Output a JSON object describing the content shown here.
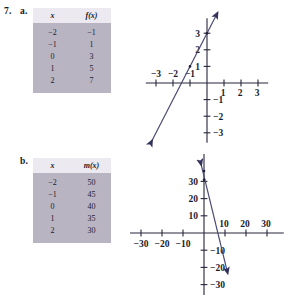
{
  "exercise": {
    "number": "7.",
    "part_a_label": "a.",
    "part_b_label": "b."
  },
  "part_a": {
    "table": {
      "headers": [
        "x",
        "f(x)"
      ],
      "rows": [
        [
          "−2",
          "−1"
        ],
        [
          "−1",
          "1"
        ],
        [
          "0",
          "3"
        ],
        [
          "1",
          "5"
        ],
        [
          "2",
          "7"
        ]
      ]
    },
    "chart_data": {
      "type": "line",
      "title": "",
      "xlabel": "",
      "ylabel": "",
      "xlim": [
        -3.6,
        3.6
      ],
      "ylim": [
        -3.6,
        3.9
      ],
      "grid": false,
      "x_ticks": [
        -3,
        -2,
        -1,
        1,
        2,
        3
      ],
      "y_ticks": [
        -3,
        -2,
        -1,
        1,
        2,
        3
      ],
      "x_tick_labels": [
        "−3",
        "−2",
        "−1",
        "1",
        "2",
        "3"
      ],
      "y_tick_labels": [
        "−3",
        "−2",
        "−1",
        "1",
        "2",
        "3"
      ],
      "series": [
        {
          "name": "f(x) = 2x + 3",
          "slope": 2,
          "intercept": 3,
          "x_from": -3.3,
          "x_to": 0.55,
          "arrows": "both"
        }
      ],
      "points": [
        {
          "x": -1,
          "y": 1
        },
        {
          "x": 0,
          "y": 3
        }
      ]
    }
  },
  "part_b": {
    "table": {
      "headers": [
        "x",
        "m(x)"
      ],
      "rows": [
        [
          "−2",
          "50"
        ],
        [
          "−1",
          "45"
        ],
        [
          "0",
          "40"
        ],
        [
          "1",
          "35"
        ],
        [
          "2",
          "30"
        ]
      ]
    },
    "chart_data": {
      "type": "line",
      "title": "",
      "xlabel": "",
      "ylabel": "",
      "xlim": [
        -38,
        38
      ],
      "ylim": [
        -36,
        46
      ],
      "grid": false,
      "x_ticks": [
        -30,
        -20,
        -10,
        10,
        20,
        30
      ],
      "y_ticks": [
        -30,
        -20,
        -10,
        10,
        20,
        30
      ],
      "x_tick_labels": [
        "−30",
        "−20",
        "−10",
        "10",
        "20",
        "30"
      ],
      "y_tick_labels": [
        "−30",
        "−20",
        "−10",
        "10",
        "20",
        "30"
      ],
      "series": [
        {
          "name": "m(x)",
          "slope": -5,
          "intercept": 33,
          "x_from": -1.6,
          "x_to": 11,
          "arrows": "both"
        }
      ],
      "points": [
        {
          "x": 0,
          "y": 36
        },
        {
          "x": 0,
          "y": 31
        }
      ]
    }
  }
}
